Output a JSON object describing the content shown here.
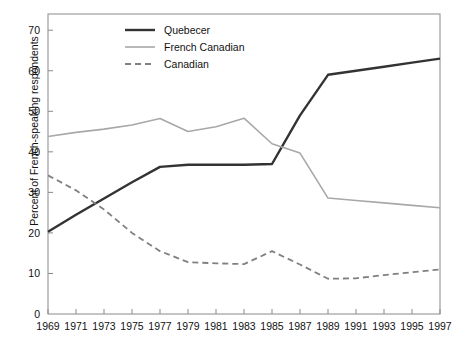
{
  "chart_data": {
    "type": "line",
    "title": "",
    "xlabel": "",
    "ylabel": "Percent of French-speaking respondents",
    "xlim": [
      1969,
      1997
    ],
    "ylim": [
      0,
      74
    ],
    "grid": false,
    "legend_position": "top-center",
    "x": [
      1969,
      1971,
      1973,
      1975,
      1977,
      1979,
      1981,
      1983,
      1985,
      1987,
      1989,
      1991,
      1993,
      1995,
      1997
    ],
    "xticklabels": [
      "1969",
      "1971",
      "1973",
      "1975",
      "1977",
      "1979",
      "1981",
      "1983",
      "1985",
      "1987",
      "1989",
      "1991",
      "1993",
      "1995",
      "1997"
    ],
    "yticks": [
      0,
      10,
      20,
      30,
      40,
      50,
      60,
      70
    ],
    "yticklabels": [
      "0",
      "10",
      "20",
      "30",
      "40",
      "50",
      "60",
      "70"
    ],
    "series": [
      {
        "name": "Quebecer",
        "color": "#333333",
        "style": "solid",
        "width": 2.4,
        "values": [
          20.3,
          24.5,
          28.5,
          32.5,
          36.3,
          36.8,
          36.8,
          36.8,
          37.0,
          49.0,
          59.0,
          60.0,
          61.0,
          62.0,
          63.0
        ]
      },
      {
        "name": "French Canadian",
        "color": "#a8a8a8",
        "style": "solid",
        "width": 1.6,
        "values": [
          43.8,
          44.8,
          45.6,
          46.6,
          48.2,
          45.0,
          46.2,
          48.3,
          42.0,
          39.7,
          28.6,
          28.0,
          27.4,
          26.8,
          26.2
        ]
      },
      {
        "name": "Canadian",
        "color": "#808080",
        "style": "dashed",
        "width": 1.8,
        "values": [
          34.2,
          30.5,
          25.8,
          20.0,
          15.5,
          12.8,
          12.5,
          12.3,
          15.5,
          12.2,
          8.7,
          8.8,
          9.6,
          10.3,
          11.0
        ]
      }
    ]
  },
  "legend": {
    "items": [
      {
        "label": "Quebecer"
      },
      {
        "label": "French Canadian"
      },
      {
        "label": "Canadian"
      }
    ]
  },
  "axes": {
    "ylabel": "Percent of French-speaking respondents"
  }
}
